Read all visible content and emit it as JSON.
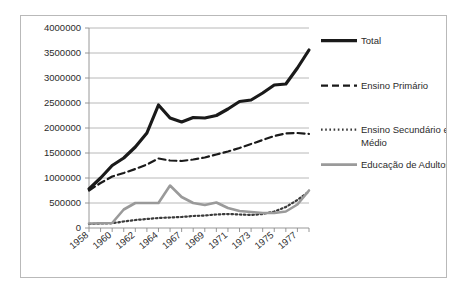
{
  "chart_data": {
    "type": "line",
    "title": "",
    "xlabel": "",
    "ylabel": "",
    "ylim": [
      0,
      4000000
    ],
    "ytick_labels": [
      "0",
      "500000",
      "1000000",
      "1500000",
      "2000000",
      "2500000",
      "3000000",
      "3500000",
      "4000000"
    ],
    "ytick_values": [
      0,
      500000,
      1000000,
      1500000,
      2000000,
      2500000,
      3000000,
      3500000,
      4000000
    ],
    "grid": true,
    "legend_position": "right",
    "x": [
      1958,
      1959,
      1960,
      1961,
      1962,
      1963,
      1964,
      1965,
      1966,
      1967,
      1968,
      1969,
      1970,
      1971,
      1972,
      1973,
      1974,
      1975,
      1976,
      1977
    ],
    "xtick_labels": [
      "1958",
      "1960",
      "1962",
      "1964",
      "1967",
      "1969",
      "1971",
      "1973",
      "1975",
      "1977"
    ],
    "xtick_label_indices": [
      0,
      2,
      4,
      6,
      8,
      10,
      12,
      14,
      16,
      18
    ],
    "series": [
      {
        "name": "Total",
        "style": "solid",
        "color": "#1a1a1a",
        "width": 3.2,
        "values": [
          780000,
          1000000,
          1250000,
          1400000,
          1620000,
          1900000,
          2460000,
          2200000,
          2120000,
          2210000,
          2200000,
          2250000,
          2380000,
          2530000,
          2560000,
          2700000,
          2860000,
          2880000,
          3200000,
          3560000
        ]
      },
      {
        "name": "Ensino Primário",
        "style": "dashed",
        "color": "#1a1a1a",
        "width": 2.2,
        "values": [
          750000,
          900000,
          1030000,
          1100000,
          1180000,
          1270000,
          1390000,
          1350000,
          1340000,
          1370000,
          1410000,
          1470000,
          1530000,
          1600000,
          1680000,
          1760000,
          1840000,
          1890000,
          1900000,
          1880000
        ]
      },
      {
        "name": "Ensino Secundário e Médio",
        "style": "dotted",
        "color": "#3a3a3a",
        "width": 2.2,
        "values": [
          80000,
          90000,
          95000,
          130000,
          160000,
          180000,
          200000,
          210000,
          220000,
          240000,
          250000,
          270000,
          280000,
          270000,
          260000,
          280000,
          330000,
          420000,
          560000,
          730000
        ]
      },
      {
        "name": "Educação de Adultos",
        "style": "solid",
        "color": "#9a9a9a",
        "width": 2.6,
        "values": [
          90000,
          95000,
          100000,
          370000,
          500000,
          500000,
          500000,
          850000,
          620000,
          500000,
          460000,
          510000,
          400000,
          340000,
          320000,
          300000,
          300000,
          330000,
          470000,
          750000
        ]
      }
    ]
  },
  "legend": {
    "items": [
      {
        "label": "Total"
      },
      {
        "label": "Ensino Primário"
      },
      {
        "label": "Ensino Secundário e"
      },
      {
        "label": "Médio"
      },
      {
        "label": "Educação de Adultos"
      }
    ]
  }
}
